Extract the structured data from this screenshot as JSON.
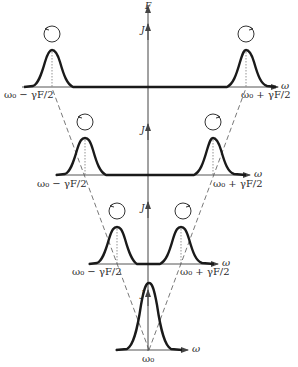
{
  "figure": {
    "type": "Zeeman-like splitting diagram: spectral line splitting into two circularly polarized components as field increases",
    "vertical_axis": {
      "top_label": "F",
      "field_labels": [
        "J",
        "J",
        "J",
        "J"
      ]
    },
    "horizontal_axis_label": "ω",
    "levels": [
      {
        "name": "level-1",
        "left_label": "ω₀ − γF/2",
        "right_label": "ω₀ + γF/2",
        "left_rotation": "counterclockwise",
        "right_rotation": "clockwise"
      },
      {
        "name": "level-2",
        "left_label": "ω₀ − γF/2",
        "right_label": "ω₀ + γF/2",
        "left_rotation": "counterclockwise",
        "right_rotation": "clockwise"
      },
      {
        "name": "level-3",
        "left_label": "ω₀ − γF/2",
        "right_label": "ω₀ + γF/2",
        "left_rotation": "counterclockwise",
        "right_rotation": "clockwise"
      },
      {
        "name": "level-4",
        "center_label": "ω₀"
      }
    ],
    "colors": {
      "curve": "#1a1a1a",
      "lines": "#555555",
      "background": "#ffffff"
    }
  }
}
